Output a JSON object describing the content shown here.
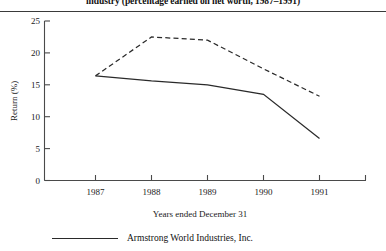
{
  "caption": "industry (percentage earned on net worth, 1987–1991)",
  "legend": [
    {
      "label": "Armstrong World Industries, Inc.",
      "style": "solid"
    }
  ],
  "chart_data": {
    "type": "line",
    "title": "industry (percentage earned on net worth, 1987–1991)",
    "xlabel": "Years ended December 31",
    "ylabel": "Return (%)",
    "categories": [
      "1987",
      "1988",
      "1989",
      "1990",
      "1991"
    ],
    "x": [
      1987,
      1988,
      1989,
      1990,
      1991
    ],
    "ylim": [
      0,
      25
    ],
    "yticks": [
      0,
      5,
      10,
      15,
      20,
      25
    ],
    "grid": false,
    "legend_position": "below",
    "series": [
      {
        "name": "Armstrong World Industries, Inc.",
        "style": "solid",
        "values": [
          16.4,
          15.6,
          15.0,
          13.5,
          6.6
        ]
      },
      {
        "name": "Industry",
        "style": "dashed",
        "values": [
          16.4,
          22.5,
          22.0,
          17.5,
          13.2
        ]
      }
    ]
  }
}
